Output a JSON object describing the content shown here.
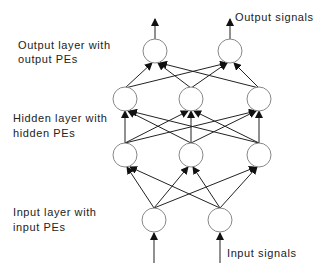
{
  "diagram": {
    "labels": {
      "output_signals": "Output signals",
      "output_layer_line1": "Output layer with",
      "output_layer_line2": "output PEs",
      "hidden_layer_line1": "Hidden layer with",
      "hidden_layer_line2": "hidden PEs",
      "input_layer_line1": "Input layer with",
      "input_layer_line2": "input PEs",
      "input_signals": "Input signals"
    },
    "layers": [
      {
        "name": "output",
        "nodes": 2
      },
      {
        "name": "hidden-upper",
        "nodes": 3
      },
      {
        "name": "hidden-lower",
        "nodes": 3
      },
      {
        "name": "input",
        "nodes": 2
      }
    ],
    "colors": {
      "stroke": "#222222",
      "node_stroke": "#888888",
      "background": "#ffffff"
    }
  }
}
